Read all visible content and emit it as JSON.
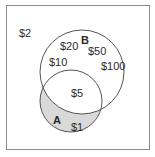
{
  "diagram": {
    "type": "venn",
    "sets": [
      {
        "id": "A",
        "label": "A"
      },
      {
        "id": "B",
        "label": "B"
      }
    ],
    "regions": {
      "outside": [
        "$2"
      ],
      "B_only": [
        "$20",
        "$50",
        "$10",
        "$100"
      ],
      "A_and_B": [
        "$5"
      ],
      "A_only": [
        "$1"
      ]
    },
    "shaded_region": "A_only",
    "colors": {
      "border": "#8a8a8a",
      "circle_stroke": "#555555",
      "shade": "#d9d9d9",
      "background": "#ffffff",
      "text": "#2a2a2a"
    }
  },
  "labels": {
    "outside_0": "$2",
    "b_label": "B",
    "b_0": "$20",
    "b_1": "$50",
    "b_2": "$10",
    "b_3": "$100",
    "ab_0": "$5",
    "a_label": "A",
    "a_0": "$1"
  }
}
